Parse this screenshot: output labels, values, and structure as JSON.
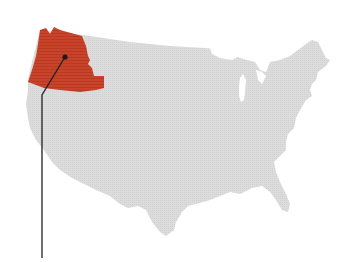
{
  "map": {
    "subject": "Contiguous United States",
    "base_color": "#dcdcdc",
    "highlight_color": "#c8432a",
    "leader_color": "#222222",
    "highlighted_region": {
      "name": "Pacific Northwest",
      "states": [
        "Washington",
        "Oregon",
        "Idaho"
      ]
    },
    "leader": {
      "anchor": [
        65,
        57
      ],
      "elbow": [
        42,
        95
      ],
      "end": [
        42,
        258
      ]
    }
  }
}
